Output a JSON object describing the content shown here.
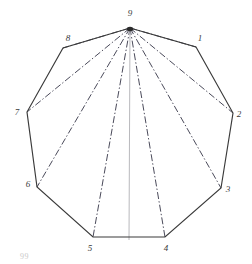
{
  "figure": {
    "shape_type": "nonagon",
    "stroke_color": "#3a3a3a",
    "diagonal_color": "#4a4a5a",
    "axis_color": "#b9b9bd",
    "background": "#ffffff",
    "apex_vertex": "9",
    "outline": {
      "points": "130,28 196,47 233,113 221,188 165,237 93,237 37,187 27,112 63,48",
      "stroke_width": 1.15
    },
    "center_axis": {
      "x1": 130,
      "y1": 28,
      "x2": 129,
      "y2": 240,
      "stroke_width": 1.0
    },
    "vertices": [
      {
        "id": "v1",
        "label": "1",
        "x": 196,
        "y": 47,
        "label_x": 200,
        "label_y": 38
      },
      {
        "id": "v2",
        "label": "2",
        "x": 233,
        "y": 113,
        "label_x": 239,
        "label_y": 114
      },
      {
        "id": "v3",
        "label": "3",
        "x": 221,
        "y": 188,
        "label_x": 228,
        "label_y": 189
      },
      {
        "id": "v4",
        "label": "4",
        "x": 165,
        "y": 237,
        "label_x": 166,
        "label_y": 248
      },
      {
        "id": "v5",
        "label": "5",
        "x": 93,
        "y": 237,
        "label_x": 90,
        "label_y": 248
      },
      {
        "id": "v6",
        "label": "6",
        "x": 37,
        "y": 187,
        "label_x": 28,
        "label_y": 184
      },
      {
        "id": "v7",
        "label": "7",
        "x": 27,
        "y": 112,
        "label_x": 17,
        "label_y": 112
      },
      {
        "id": "v8",
        "label": "8",
        "x": 63,
        "y": 48,
        "label_x": 68,
        "label_y": 38
      },
      {
        "id": "v9",
        "label": "9",
        "x": 130,
        "y": 28,
        "label_x": 130,
        "label_y": 13
      }
    ],
    "diagonals": [
      {
        "id": "d9-1",
        "from": "9",
        "to": "1",
        "x1": 130,
        "y1": 28,
        "x2": 196,
        "y2": 47
      },
      {
        "id": "d9-2",
        "from": "9",
        "to": "2",
        "x1": 130,
        "y1": 28,
        "x2": 233,
        "y2": 113
      },
      {
        "id": "d9-3",
        "from": "9",
        "to": "3",
        "x1": 130,
        "y1": 28,
        "x2": 221,
        "y2": 188
      },
      {
        "id": "d9-4",
        "from": "9",
        "to": "4",
        "x1": 130,
        "y1": 28,
        "x2": 165,
        "y2": 237
      },
      {
        "id": "d9-5",
        "from": "9",
        "to": "5",
        "x1": 130,
        "y1": 28,
        "x2": 93,
        "y2": 237
      },
      {
        "id": "d9-6",
        "from": "9",
        "to": "6",
        "x1": 130,
        "y1": 28,
        "x2": 37,
        "y2": 187
      },
      {
        "id": "d9-7",
        "from": "9",
        "to": "7",
        "x1": 130,
        "y1": 28,
        "x2": 27,
        "y2": 112
      },
      {
        "id": "d9-8",
        "from": "9",
        "to": "8",
        "x1": 130,
        "y1": 28,
        "x2": 63,
        "y2": 48
      }
    ],
    "corner_note": "99"
  }
}
